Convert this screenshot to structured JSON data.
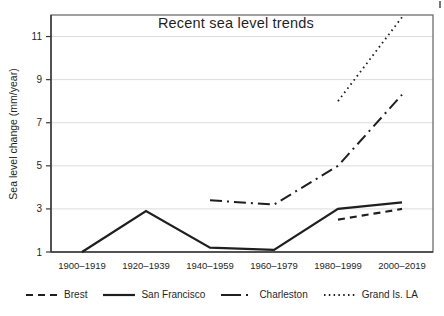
{
  "figure_title": "Recent sea level trends",
  "chart_data": {
    "type": "line",
    "title": "Recent sea level trends",
    "xlabel": "",
    "ylabel": "Sea level change (mm/year)",
    "categories": [
      "1900–1919",
      "1920–1939",
      "1940–1959",
      "1960–1979",
      "1980–1999",
      "2000–2019"
    ],
    "yticks": [
      1,
      3,
      5,
      7,
      9,
      11
    ],
    "ylim": [
      1,
      12
    ],
    "grid": true,
    "legend_position": "bottom-center",
    "series": [
      {
        "name": "Brest",
        "style": "dashed",
        "values": [
          null,
          null,
          null,
          null,
          2.5,
          3.0
        ]
      },
      {
        "name": "San Francisco",
        "style": "solid",
        "values": [
          1.0,
          2.9,
          1.2,
          1.1,
          3.0,
          3.3
        ]
      },
      {
        "name": "Charleston",
        "style": "dashdot",
        "values": [
          null,
          null,
          3.4,
          3.2,
          5.0,
          8.3
        ]
      },
      {
        "name": "Grand Is. LA",
        "style": "dotted",
        "values": [
          null,
          null,
          null,
          null,
          8.0,
          11.9
        ]
      }
    ],
    "colors": {
      "line": "#1f1f1f",
      "grid": "#dcdcdc",
      "frame": "#6e6e6e",
      "spine": "#3a3a3a",
      "text": "#1f1f1f",
      "background": "#ffffff"
    }
  }
}
